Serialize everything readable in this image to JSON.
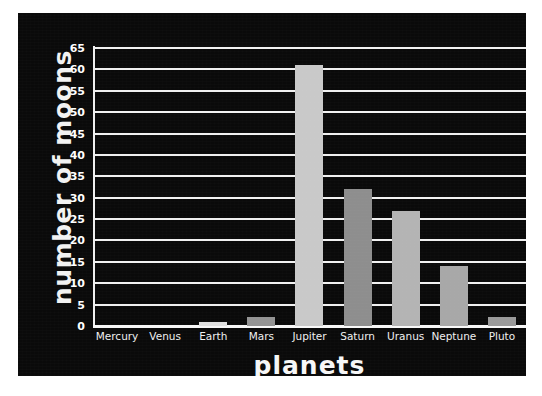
{
  "chart_data": {
    "type": "bar",
    "title": "",
    "xlabel": "planets",
    "ylabel": "number of moons",
    "categories": [
      "Mercury",
      "Venus",
      "Earth",
      "Mars",
      "Jupiter",
      "Saturn",
      "Uranus",
      "Neptune",
      "Pluto"
    ],
    "values": [
      0,
      0,
      1,
      2,
      61,
      32,
      27,
      14,
      2
    ],
    "ylim": [
      0,
      65
    ],
    "ytick_step": 5,
    "ytick_labels": [
      "0",
      "5",
      "10",
      "15",
      "20",
      "25",
      "30",
      "35",
      "40",
      "45",
      "50",
      "55",
      "60",
      "65"
    ],
    "grid": true,
    "legend": false,
    "bar_colors": [
      "#c9c9c9",
      "#c9c9c9",
      "#e0e0e0",
      "#949494",
      "#c9c9c9",
      "#8e8e8e",
      "#b4b4b4",
      "#a8a8a8",
      "#9a9a9a"
    ],
    "background_color": "#0a0a0a",
    "grid_color": "#f0f0f0",
    "text_color": "#ffffff"
  }
}
